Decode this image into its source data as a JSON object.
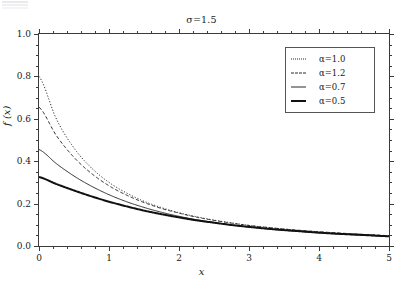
{
  "chart_data": {
    "type": "line",
    "title": "σ=1.5",
    "xlabel": "x",
    "ylabel": "f (x)",
    "xlim": [
      0,
      5
    ],
    "ylim": [
      0,
      1.0
    ],
    "xticks": [
      "0",
      "1",
      "2",
      "3",
      "4",
      "5"
    ],
    "xtick_values": [
      0,
      1,
      2,
      3,
      4,
      5
    ],
    "yticks": [
      "0.0",
      "0.2",
      "0.4",
      "0.6",
      "0.8",
      "1.0"
    ],
    "ytick_values": [
      0,
      0.2,
      0.4,
      0.6,
      0.8,
      1.0
    ],
    "grid": false,
    "minor_ticks": true,
    "legend_position": "top-right",
    "x": [
      0,
      0.25,
      0.5,
      0.75,
      1.0,
      1.25,
      1.5,
      1.75,
      2.0,
      2.25,
      2.5,
      2.75,
      3.0,
      3.25,
      3.5,
      3.75,
      4.0,
      4.25,
      4.5,
      4.75,
      5.0
    ],
    "series": [
      {
        "name": "α=1.0",
        "label": "α=1.0",
        "alpha": 1.0,
        "style": "dotted",
        "width": 1,
        "color": "#2a2a2a",
        "values": [
          0.8,
          0.598,
          0.462,
          0.368,
          0.3,
          0.25,
          0.211,
          0.181,
          0.157,
          0.138,
          0.122,
          0.109,
          0.097,
          0.088,
          0.08,
          0.073,
          0.067,
          0.061,
          0.057,
          0.052,
          0.048
        ]
      },
      {
        "name": "α=1.2",
        "label": "α=1.2",
        "alpha": 1.2,
        "style": "dashed",
        "width": 1,
        "color": "#2a2a2a",
        "values": [
          0.655,
          0.52,
          0.418,
          0.342,
          0.284,
          0.24,
          0.205,
          0.177,
          0.155,
          0.136,
          0.121,
          0.108,
          0.097,
          0.088,
          0.08,
          0.073,
          0.067,
          0.062,
          0.057,
          0.053,
          0.049
        ]
      },
      {
        "name": "α=0.7",
        "label": "α=0.7",
        "alpha": 0.7,
        "style": "solid-thin",
        "width": 1,
        "color": "#2a2a2a",
        "values": [
          0.455,
          0.388,
          0.33,
          0.282,
          0.242,
          0.209,
          0.182,
          0.159,
          0.14,
          0.124,
          0.111,
          0.099,
          0.09,
          0.081,
          0.074,
          0.068,
          0.062,
          0.057,
          0.053,
          0.049,
          0.045
        ]
      },
      {
        "name": "α=0.5",
        "label": "α=0.5",
        "alpha": 0.5,
        "style": "solid-thick",
        "width": 2,
        "color": "#111111",
        "values": [
          0.325,
          0.292,
          0.262,
          0.234,
          0.209,
          0.187,
          0.167,
          0.15,
          0.135,
          0.121,
          0.11,
          0.099,
          0.09,
          0.082,
          0.075,
          0.069,
          0.063,
          0.058,
          0.054,
          0.05,
          0.046
        ]
      }
    ]
  },
  "axis_colors": {
    "frame": "#3a3a3a",
    "background": "#ffffff"
  }
}
